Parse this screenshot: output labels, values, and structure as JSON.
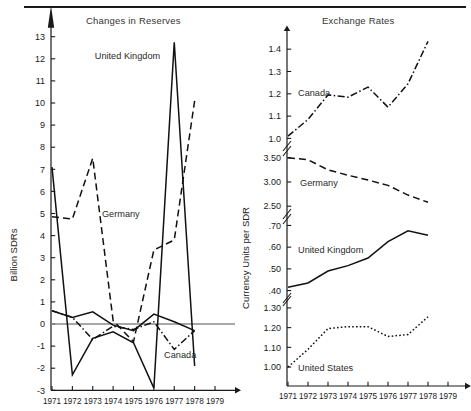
{
  "figure": {
    "divider_rule": true,
    "panels": [
      {
        "id": "changes-in-reserves",
        "title": "Changes in Reserves",
        "ylabel": "Billion SDRs"
      },
      {
        "id": "exchange-rates",
        "title": "Exchange Rates",
        "ylabel": "Currency Units per SDR"
      }
    ]
  },
  "chart_data": [
    {
      "type": "line",
      "title": "Changes in Reserves",
      "xlabel": "",
      "ylabel": "Billion SDRs",
      "x": [
        1971,
        1972,
        1973,
        1974,
        1975,
        1976,
        1977,
        1978
      ],
      "xlim": [
        1970.6,
        1979.4
      ],
      "ylim": [
        -3,
        13.6
      ],
      "yticks": [
        -3,
        -2,
        -1,
        0,
        1,
        2,
        3,
        4,
        5,
        6,
        7,
        8,
        9,
        10,
        11,
        12,
        13
      ],
      "ytick_labels": [
        "-3",
        "-2",
        "-1",
        "0",
        "1",
        "2",
        "3",
        "4",
        "5",
        "6",
        "7",
        "8",
        "9",
        "10",
        "11",
        "12",
        "13"
      ],
      "xticks": [
        1971,
        1972,
        1973,
        1974,
        1975,
        1976,
        1977,
        1978,
        1979
      ],
      "xtick_labels": [
        "1971",
        "1972",
        "1973",
        "1974",
        "1975",
        "1976",
        "1977",
        "1978",
        "1979"
      ],
      "grid": false,
      "zero_line": 0,
      "legend_position": "inline-annotations",
      "series": [
        {
          "name": "United Kingdom",
          "style": "solid",
          "label_x": 1973.1,
          "label_y": 12.0,
          "values": [
            7.1,
            -2.3,
            -0.65,
            -0.35,
            -0.85,
            -2.9,
            12.75,
            -1.9
          ]
        },
        {
          "name": "Germany",
          "style": "dashed",
          "label_x": 1973.45,
          "label_y": 4.85,
          "values": [
            4.85,
            4.75,
            7.5,
            0.15,
            -0.8,
            3.35,
            3.8,
            10.1
          ]
        },
        {
          "name": "Canada",
          "style": "dash-dot",
          "label_x": 1976.5,
          "label_y": -1.55,
          "values": [
            0.6,
            0.3,
            -0.7,
            -0.1,
            -0.25,
            0.1,
            -1.15,
            -0.3
          ]
        },
        {
          "name": "United Kingdom secondary segment",
          "style": "solid",
          "values": [
            0.6,
            0.3,
            0.55,
            -0.05,
            -0.3,
            0.45,
            0.1,
            -0.3
          ]
        }
      ]
    },
    {
      "type": "line",
      "title": "Exchange Rates",
      "xlabel": "",
      "ylabel": "Currency Units per SDR",
      "x": [
        1971,
        1972,
        1973,
        1974,
        1975,
        1976,
        1977,
        1978
      ],
      "xticks": [
        1971,
        1972,
        1973,
        1974,
        1975,
        1976,
        1977,
        1978,
        1979
      ],
      "xtick_labels": [
        "1971",
        "1972",
        "1973",
        "1974",
        "1975",
        "1976",
        "1977",
        "1978",
        "1979"
      ],
      "broken_axis": true,
      "grid": false,
      "legend_position": "inline-annotations",
      "subpanels": [
        {
          "name": "Canada",
          "style": "dash-dot",
          "yticks": [
            1.0,
            1.1,
            1.2,
            1.3,
            1.4
          ],
          "ytick_labels": [
            "1.0",
            "1.1",
            "1.2",
            "1.3",
            "1.4"
          ],
          "ylim": [
            0.975,
            1.45
          ],
          "label_x": 1971.5,
          "label_y": 1.205,
          "values": [
            1.01,
            1.085,
            1.195,
            1.185,
            1.23,
            1.14,
            1.245,
            1.435
          ]
        },
        {
          "name": "Germany",
          "style": "dashed",
          "yticks": [
            2.5,
            3.0,
            3.5
          ],
          "ytick_labels": [
            "2.50",
            "3.00",
            "3.50"
          ],
          "ylim": [
            2.38,
            3.62
          ],
          "label_x": 1971.6,
          "label_y": 2.98,
          "values": [
            3.5,
            3.46,
            3.25,
            3.14,
            3.04,
            2.93,
            2.73,
            2.58
          ]
        },
        {
          "name": "United Kingdom",
          "style": "solid",
          "yticks": [
            0.4,
            0.5,
            0.6,
            0.7
          ],
          "ytick_labels": [
            ".40",
            ".50",
            ".60",
            ".70"
          ],
          "ylim": [
            0.375,
            0.725
          ],
          "label_x": 1971.5,
          "label_y": 0.585,
          "values": [
            0.415,
            0.435,
            0.49,
            0.515,
            0.55,
            0.625,
            0.675,
            0.655
          ]
        },
        {
          "name": "United States",
          "style": "dotted",
          "yticks": [
            1.0,
            1.1,
            1.2,
            1.3
          ],
          "ytick_labels": [
            "1.00",
            "1.10",
            "1.20",
            "1.30"
          ],
          "ylim": [
            0.975,
            1.33
          ],
          "label_x": 1971.5,
          "label_y": 0.995,
          "values": [
            1.0,
            1.09,
            1.195,
            1.205,
            1.205,
            1.155,
            1.165,
            1.255
          ]
        }
      ]
    }
  ]
}
